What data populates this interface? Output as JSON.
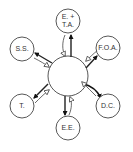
{
  "diagram": {
    "hub": {
      "cx": 68,
      "cy": 76,
      "r": 20
    },
    "nodes": [
      {
        "id": "eta",
        "label_line1": "E. +",
        "label_line2": "T.A.",
        "cx": 68,
        "cy": 21,
        "r": 12
      },
      {
        "id": "foa",
        "label_line1": "F.O.A.",
        "label_line2": "",
        "cx": 108,
        "cy": 48,
        "r": 12
      },
      {
        "id": "dc",
        "label_line1": "D.C.",
        "label_line2": "",
        "cx": 108,
        "cy": 106,
        "r": 12
      },
      {
        "id": "ee",
        "label_line1": "E.E.",
        "label_line2": "",
        "cx": 68,
        "cy": 128,
        "r": 12
      },
      {
        "id": "t",
        "label_line1": "T.",
        "label_line2": "",
        "cx": 22,
        "cy": 106,
        "r": 12
      },
      {
        "id": "ss",
        "label_line1": "S.S.",
        "label_line2": "",
        "cx": 22,
        "cy": 49,
        "r": 12
      }
    ],
    "colors": {
      "stroke": "#444444",
      "fill": "#ffffff",
      "arrow_filled": "#111111",
      "arrow_open": "#ffffff"
    }
  }
}
